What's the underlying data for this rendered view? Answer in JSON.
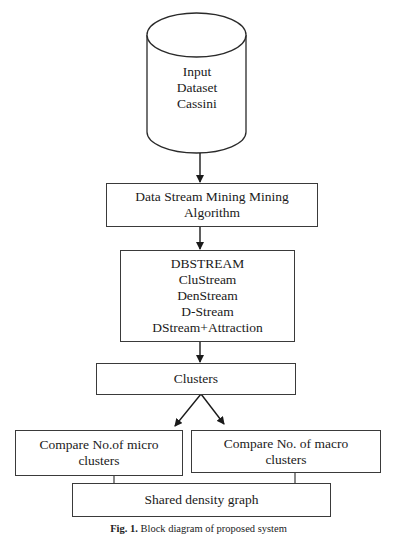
{
  "diagram": {
    "datastore": {
      "lines": [
        "Input",
        "Dataset",
        "Cassini"
      ]
    },
    "mining_box": {
      "lines": [
        "Data Stream Mining Mining",
        "Algorithm"
      ]
    },
    "algorithms_box": {
      "lines": [
        "DBSTREAM",
        "CluStream",
        "DenStream",
        "D-Stream",
        "DStream+Attraction"
      ]
    },
    "clusters_box": {
      "label": "Clusters"
    },
    "micro_box": {
      "lines": [
        "Compare No.of micro",
        "clusters"
      ]
    },
    "macro_box": {
      "lines": [
        "Compare No. of macro",
        "clusters"
      ]
    },
    "shared_box": {
      "label": "Shared density graph"
    },
    "caption": {
      "fig": "Fig. 1.",
      "text": "Block diagram of proposed system"
    },
    "colors": {
      "stroke": "#3a3a3a",
      "text": "#1a1a1a",
      "background": "#ffffff"
    }
  }
}
